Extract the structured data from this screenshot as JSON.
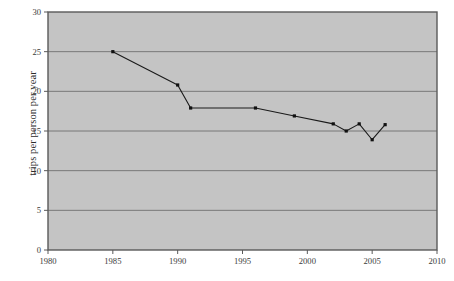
{
  "chart_data": {
    "type": "line",
    "title": "",
    "subtitle": "",
    "xlabel": "",
    "ylabel": "trips per person per year",
    "xlim": [
      1980,
      2010
    ],
    "ylim": [
      0,
      30
    ],
    "x_ticks": [
      1980,
      1985,
      1990,
      1995,
      2000,
      2005,
      2010
    ],
    "x_tick_labels": [
      "1980",
      "1985",
      "1990",
      "1995",
      "2000",
      "2005",
      "2010"
    ],
    "y_ticks": [
      0,
      5,
      10,
      15,
      20,
      25,
      30
    ],
    "y_tick_labels": [
      "0",
      "5",
      "10",
      "15",
      "20",
      "25",
      "30"
    ],
    "grid": {
      "horizontal": true,
      "vertical": false,
      "color": "#6f6f6f"
    },
    "legend": {
      "visible": false,
      "position": "none",
      "entries": []
    },
    "plot_background_color": "#c4c4c4",
    "figure_background_color": "#ffffff",
    "frame_color": "#5a5a5a",
    "series": [
      {
        "name": "trips per person per year",
        "line_color": "#1a1a1a",
        "marker": "square",
        "marker_color": "#111111",
        "x": [
          1985,
          1990,
          1991,
          1996,
          1999,
          2002,
          2003,
          2004,
          2005,
          2006
        ],
        "values": [
          25.0,
          20.8,
          17.9,
          17.9,
          16.9,
          15.9,
          15.0,
          15.9,
          13.9,
          15.8
        ],
        "points": [
          {
            "x": 1985,
            "y": 25.0
          },
          {
            "x": 1990,
            "y": 20.8
          },
          {
            "x": 1991,
            "y": 17.9
          },
          {
            "x": 1996,
            "y": 17.9
          },
          {
            "x": 1999,
            "y": 16.9
          },
          {
            "x": 2002,
            "y": 15.9
          },
          {
            "x": 2003,
            "y": 15.0
          },
          {
            "x": 2004,
            "y": 15.9
          },
          {
            "x": 2005,
            "y": 13.9
          },
          {
            "x": 2006,
            "y": 15.8
          }
        ]
      }
    ],
    "annotations": []
  }
}
